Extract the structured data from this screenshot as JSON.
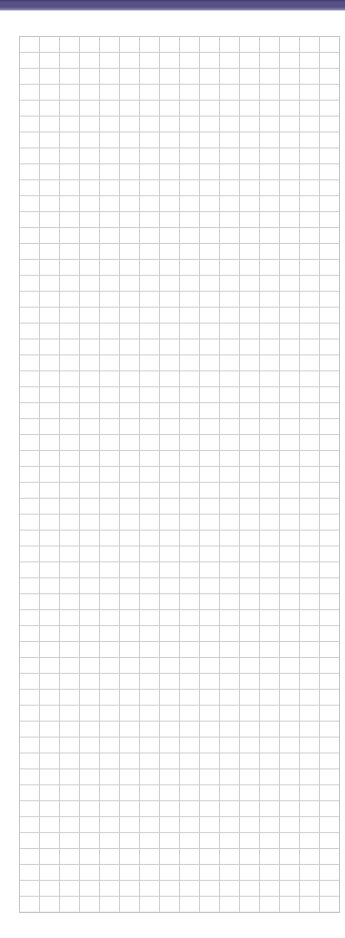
{
  "page": {
    "width_px": 345,
    "height_px": 938,
    "background_color": "#ffffff"
  },
  "top_bar": {
    "height_px": 10,
    "color_top": "#423c6e",
    "color_main": "#565085",
    "color_bottom": "#8c86b4",
    "underline_color": "#cfccdf"
  },
  "grid": {
    "left_px": 19,
    "top_px": 36,
    "width_px": 321,
    "height_px": 877,
    "columns": 16,
    "rows": 55,
    "cell_width_px": 20,
    "cell_height_px": 15.93,
    "line_color": "#cdced4",
    "border_color": "#c4c5cb",
    "paper_color": "#ffffff"
  }
}
